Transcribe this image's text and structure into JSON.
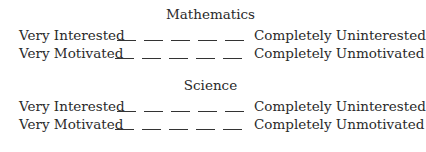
{
  "sections": [
    {
      "title": "Mathematics",
      "rows": [
        {
          "left": "Very Interested",
          "right": "Completely Uninterested",
          "blanks": 5
        },
        {
          "left": "Very Motivated",
          "right": "Completely Unmotivated",
          "blanks": 5
        }
      ]
    },
    {
      "title": "Science",
      "rows": [
        {
          "left": "Very Interested",
          "right": "Completely Uninterested",
          "blanks": 5
        },
        {
          "left": "Very Motivated",
          "right": "Completely Unmotivated",
          "blanks": 5
        }
      ]
    }
  ]
}
